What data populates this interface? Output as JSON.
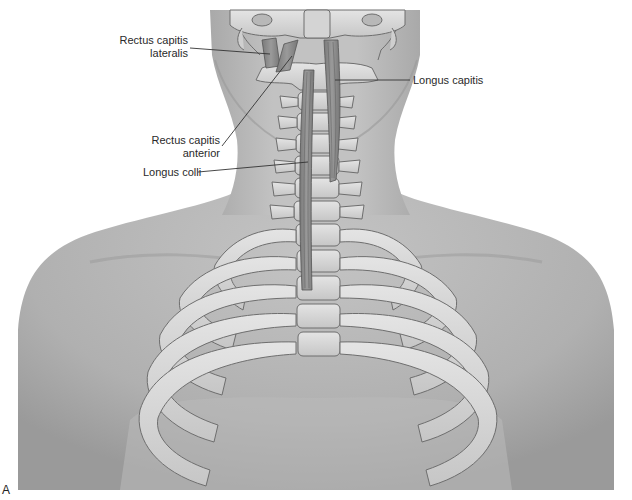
{
  "figure": {
    "panel_letter": "A",
    "colors": {
      "background": "#ffffff",
      "skin_light": "#c9c9c9",
      "skin_mid": "#a8a8a8",
      "skin_dark": "#8c8c8c",
      "bone": "#d9d9d9",
      "bone_outline": "#6e6e6e",
      "muscle": "#8a8a8a",
      "muscle_stripe": "#5f5f5f",
      "leader_line": "#333333",
      "label_text": "#2a2a2a"
    }
  },
  "labels": {
    "rectus_capitis_lateralis": {
      "line1": "Rectus capitis",
      "line2": "lateralis"
    },
    "rectus_capitis_anterior": {
      "line1": "Rectus capitis",
      "line2": "anterior"
    },
    "longus_capitis": {
      "text": "Longus capitis"
    },
    "longus_colli": {
      "text": "Longus colli"
    }
  }
}
